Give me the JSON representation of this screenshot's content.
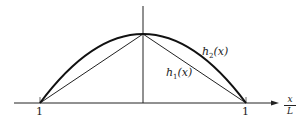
{
  "diagram": {
    "curves": [
      {
        "name": "h2(x)",
        "type": "parabola",
        "label": "h",
        "subscript": "2",
        "arg": "(x)"
      },
      {
        "name": "h1(x)",
        "type": "triangle",
        "label": "h",
        "subscript": "1",
        "arg": "(x)"
      }
    ],
    "axis": {
      "label_numerator": "x",
      "label_denominator": "L",
      "left_tick": "1",
      "right_tick": "1"
    },
    "colors": {
      "line": "#222222",
      "background": "#ffffff"
    }
  }
}
